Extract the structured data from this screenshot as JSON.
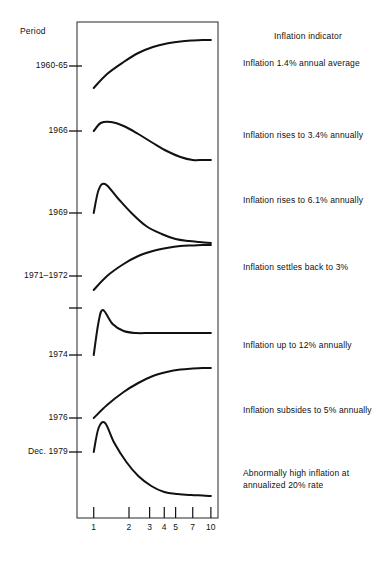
{
  "headers": {
    "period": "Period",
    "indicator": "Inflation indicator"
  },
  "chart_data": {
    "type": "line",
    "title": "",
    "subtitle": "",
    "xlabel": "",
    "ylabel": "Period",
    "grid": false,
    "legend_position": "right",
    "x_scale": "log",
    "x_ticks": [
      1,
      2,
      3,
      4,
      5,
      7,
      10
    ],
    "x_tick_labels": [
      "1",
      "2",
      "3",
      "4",
      "5",
      "7",
      "10"
    ],
    "xlim": [
      0.72,
      11.5
    ],
    "y_axis_note": "Each period occupies its own horizontal band; the y axis tick marks the starting inflation level of that period.",
    "series": [
      {
        "name": "1960-65",
        "period_label": "1960-65",
        "indicator": "Inflation 1.4% annual average",
        "shape": "rising-plateau",
        "start_level": 88,
        "end_level": 40,
        "peak_level": 40,
        "x": [
          1,
          1.3,
          1.8,
          2.4,
          3.2,
          4.2,
          5.5,
          7,
          8.5,
          10
        ],
        "y": [
          88,
          74,
          62,
          53,
          47,
          43.5,
          41.5,
          40.5,
          40,
          40
        ]
      },
      {
        "name": "1966",
        "period_label": "1966",
        "indicator": "Inflation rises to 3.4% annually",
        "shape": "hump-decline",
        "start_level": 131,
        "end_level": 160,
        "peak_level": 122,
        "x": [
          1,
          1.15,
          1.4,
          1.8,
          2.4,
          3.2,
          4.2,
          5.5,
          7,
          8.5,
          10
        ],
        "y": [
          131,
          123,
          122,
          126,
          134,
          143,
          151,
          157,
          160,
          160,
          160
        ]
      },
      {
        "name": "1969",
        "period_label": "1969",
        "indicator": "Inflation rises to 6.1% annually",
        "shape": "spike-decay",
        "start_level": 213,
        "end_level": 243,
        "peak_level": 184,
        "x": [
          1,
          1.1,
          1.25,
          1.6,
          2.1,
          2.8,
          3.8,
          5,
          6.5,
          8,
          10
        ],
        "y": [
          213,
          190,
          184,
          198,
          213,
          226,
          234,
          239,
          241,
          242,
          243
        ]
      },
      {
        "name": "1971-1972",
        "period_label": "1971–1972",
        "indicator": "Inflation settles back to 3%",
        "shape": "rising-plateau",
        "start_level": 290,
        "end_level": 245,
        "peak_level": 245,
        "x": [
          1,
          1.3,
          1.8,
          2.4,
          3.2,
          4.2,
          5.5,
          7,
          8.5,
          10
        ],
        "y": [
          290,
          276,
          264,
          256,
          251,
          248,
          246,
          245.5,
          245,
          245
        ]
      },
      {
        "name": "1974",
        "period_label": "1974",
        "indicator": "Inflation up to 12% annually",
        "shape": "sharp-spike",
        "start_level": 355,
        "end_level": 333,
        "peak_level": 310,
        "x": [
          1,
          1.1,
          1.2,
          1.45,
          1.8,
          2.3,
          3,
          4,
          5.5,
          7.5,
          10
        ],
        "y": [
          355,
          322,
          310,
          324,
          331,
          333,
          333,
          333,
          333,
          333,
          333
        ]
      },
      {
        "name": "1976",
        "period_label": "1976",
        "indicator": "Inflation subsides to 5% annually",
        "shape": "rising-plateau",
        "start_level": 418,
        "end_level": 368,
        "peak_level": 368,
        "x": [
          1,
          1.3,
          1.8,
          2.4,
          3.2,
          4.2,
          5.5,
          7,
          8.5,
          10
        ],
        "y": [
          418,
          405,
          392,
          383,
          376,
          372,
          369.5,
          368.5,
          368,
          368
        ]
      },
      {
        "name": "Dec. 1979",
        "period_label": "Dec. 1979",
        "indicator": "Abnormally high inflation at\nannualized 20% rate",
        "shape": "tall-spike-decay",
        "start_level": 452,
        "end_level": 496,
        "peak_level": 423,
        "x": [
          1,
          1.1,
          1.25,
          1.5,
          1.9,
          2.4,
          3.1,
          4,
          5.2,
          6.8,
          8.5,
          10
        ],
        "y": [
          452,
          428,
          423,
          443,
          462,
          476,
          486,
          492,
          494,
          495,
          495.5,
          496
        ]
      }
    ]
  },
  "axis": {
    "frame": {
      "left": 77,
      "top": 22,
      "right": 218,
      "bottom": 518
    },
    "tick_marks_y": [
      {
        "label": "1960-65",
        "y": 66
      },
      {
        "label": "1966",
        "y": 131
      },
      {
        "label": "1969",
        "y": 213
      },
      {
        "label": "1971–1972",
        "y": 276
      },
      {
        "label": "",
        "y": 308
      },
      {
        "label": "1974",
        "y": 355
      },
      {
        "label": "1976",
        "y": 418
      },
      {
        "label": "Dec. 1979",
        "y": 452
      }
    ]
  }
}
